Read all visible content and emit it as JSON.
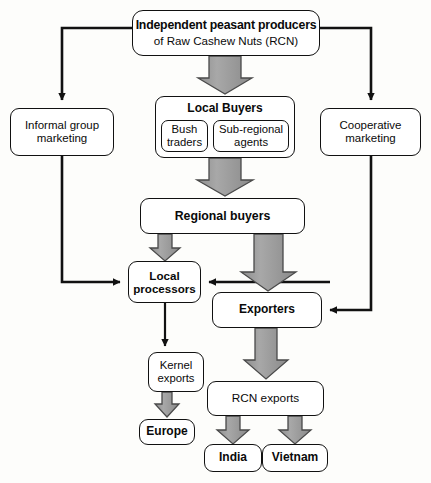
{
  "diagram": {
    "colors": {
      "node_border": "#111111",
      "node_fill": "#ffffff",
      "black_arrow": "#111111",
      "gray_arrow_fill": "#9a9a9a",
      "gray_arrow_stroke": "#4a4a4a",
      "background": "#fdfdfb"
    },
    "nodes": {
      "producers": {
        "line1": "Independent peasant producers",
        "line2": "of Raw Cashew Nuts (RCN)"
      },
      "informal_group_marketing": {
        "line1": "Informal group",
        "line2": "marketing"
      },
      "cooperative_marketing": {
        "line1": "Cooperative",
        "line2": "marketing"
      },
      "local_buyers": {
        "title": "Local Buyers",
        "children": [
          {
            "line1": "Bush",
            "line2": "traders"
          },
          {
            "line1": "Sub-regional",
            "line2": "agents"
          }
        ]
      },
      "regional_buyers": {
        "label": "Regional buyers"
      },
      "local_processors": {
        "line1": "Local",
        "line2": "processors"
      },
      "exporters": {
        "label": "Exporters"
      },
      "kernel_exports": {
        "line1": "Kernel",
        "line2": "exports"
      },
      "rcn_exports": {
        "label": "RCN exports"
      },
      "europe": {
        "label": "Europe"
      },
      "india": {
        "label": "India"
      },
      "vietnam": {
        "label": "Vietnam"
      }
    },
    "edges": [
      {
        "from": "producers",
        "to": "informal_group_marketing",
        "style": "black-line"
      },
      {
        "from": "producers",
        "to": "cooperative_marketing",
        "style": "black-line"
      },
      {
        "from": "producers",
        "to": "local_buyers",
        "style": "gray-block"
      },
      {
        "from": "local_buyers",
        "to": "regional_buyers",
        "style": "gray-block"
      },
      {
        "from": "regional_buyers",
        "to": "local_processors",
        "style": "gray-block"
      },
      {
        "from": "regional_buyers",
        "to": "exporters",
        "style": "gray-block"
      },
      {
        "from": "informal_group_marketing",
        "to": "local_processors",
        "style": "black-line"
      },
      {
        "from": "cooperative_marketing",
        "to": "exporters",
        "style": "black-line"
      },
      {
        "from": "exporters",
        "to": "local_processors",
        "style": "black-line"
      },
      {
        "from": "local_processors",
        "to": "kernel_exports",
        "style": "black-line"
      },
      {
        "from": "exporters",
        "to": "rcn_exports",
        "style": "gray-block"
      },
      {
        "from": "kernel_exports",
        "to": "europe",
        "style": "gray-block"
      },
      {
        "from": "rcn_exports",
        "to": "india",
        "style": "gray-block"
      },
      {
        "from": "rcn_exports",
        "to": "vietnam",
        "style": "gray-block"
      }
    ]
  }
}
